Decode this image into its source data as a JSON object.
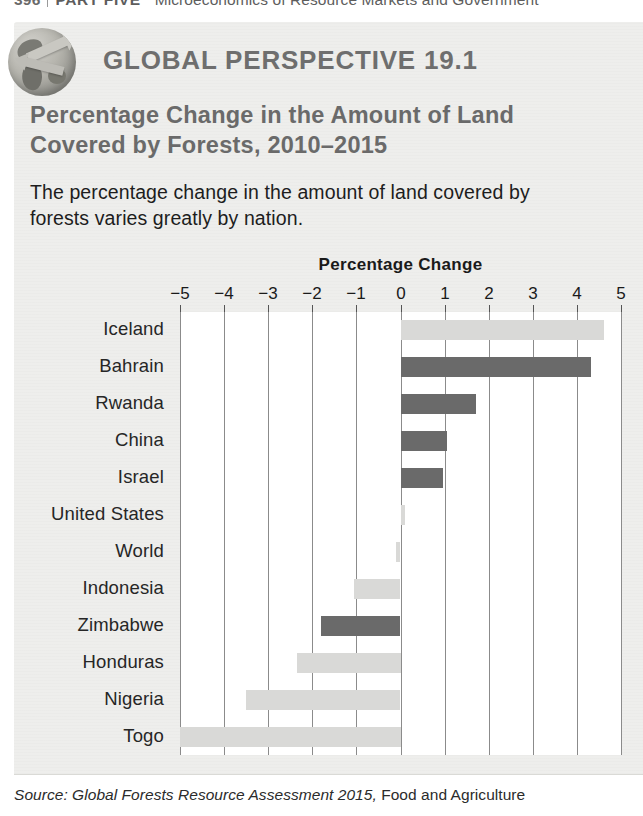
{
  "running_head": {
    "page_number": "396",
    "part": "PART FIVE",
    "subject": "Microeconomics of Resource Markets and Government"
  },
  "box": {
    "icon": "globe-icon",
    "kicker": "GLOBAL PERSPECTIVE 19.1",
    "title_line1": "Percentage Change in the Amount of Land",
    "title_line2": "Covered by Forests, 2010–2015",
    "description_line1": "The percentage change in the amount of land covered by",
    "description_line2": "forests varies greatly by nation.",
    "source_italic": "Source: Global Forests Resource Assessment 2015,",
    "source_rest": " Food and Agriculture"
  },
  "colors": {
    "panel_background": "#eeeeec",
    "plot_background": "#ffffff",
    "bar_dark": "#6a6a6a",
    "bar_light": "#d9d9d7",
    "gridline": "#8b8b8b",
    "heading_gray": "#6a6a6a"
  },
  "chart_data": {
    "type": "bar",
    "orientation": "horizontal",
    "title": "Percentage Change",
    "xlabel": "Percentage Change",
    "ylabel": "",
    "xlim": [
      -5,
      5
    ],
    "xticks": [
      -5,
      -4,
      -3,
      -2,
      -1,
      0,
      1,
      2,
      3,
      4,
      5
    ],
    "xtick_labels": [
      "−5",
      "−4",
      "−3",
      "−2",
      "−1",
      "0",
      "1",
      "2",
      "3",
      "4",
      "5"
    ],
    "grid": true,
    "legend": "none",
    "categories": [
      "Iceland",
      "Bahrain",
      "Rwanda",
      "China",
      "Israel",
      "United States",
      "World",
      "Indonesia",
      "Zimbabwe",
      "Honduras",
      "Nigeria",
      "Togo"
    ],
    "values": [
      4.6,
      4.3,
      1.7,
      1.05,
      0.95,
      0.1,
      -0.1,
      -1.05,
      -1.8,
      -2.35,
      -3.5,
      -5.0
    ],
    "bar_colors": [
      "light",
      "dark",
      "dark",
      "dark",
      "dark",
      "light",
      "light",
      "light",
      "dark",
      "light",
      "light",
      "light"
    ]
  }
}
